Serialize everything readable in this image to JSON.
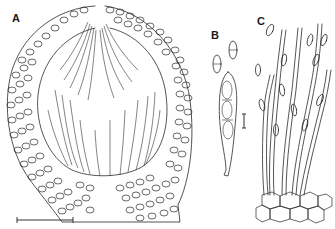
{
  "figure": {
    "panels": [
      {
        "id": "A",
        "label": "A",
        "description": "perithecium longitudinal section with wall cells and periphyses/paraphyses"
      },
      {
        "id": "B",
        "label": "B",
        "description": "ascus with ascospores and two free ascospores"
      },
      {
        "id": "C",
        "label": "C",
        "description": "conidiophores with conidia arising from basal cells"
      }
    ],
    "scale_bars": [
      {
        "panel": "A",
        "orientation": "horizontal"
      },
      {
        "panel": "B",
        "orientation": "vertical"
      }
    ],
    "colors": {
      "ink": "#2a2a2a",
      "background": "#ffffff"
    }
  }
}
